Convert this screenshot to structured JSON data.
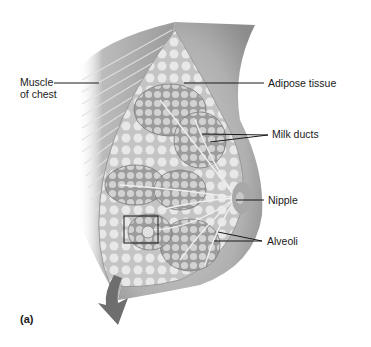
{
  "figure": {
    "panel_label": "(a)",
    "labels": {
      "muscle_line1": "Muscle",
      "muscle_line2": "of chest",
      "adipose": "Adipose tissue",
      "milk_ducts": "Milk ducts",
      "nipple": "Nipple",
      "alveoli": "Alveoli"
    },
    "colors": {
      "background": "#ffffff",
      "tissue_light": "#e6e6e6",
      "tissue_mid": "#bdbdbd",
      "tissue_dark": "#8a8a8a",
      "skin": "#b4b4b4",
      "arrow": "#6e6e6e",
      "leader_line": "#1a1a1a"
    }
  }
}
